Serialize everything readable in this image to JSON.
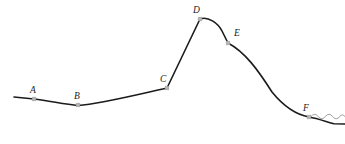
{
  "figure": {
    "width": 345,
    "height": 144,
    "background_color": "#ffffff",
    "curve_color": "#1b1b1b",
    "marker_color": "#b4b4b4",
    "label_color": "#222222",
    "squiggle_color": "#8d8d8d"
  },
  "points": [
    {
      "id": "A",
      "label": "A",
      "x": 34,
      "y": 99,
      "label_x": 30,
      "label_y": 93
    },
    {
      "id": "B",
      "label": "B",
      "x": 78,
      "y": 105,
      "label_x": 74,
      "label_y": 99
    },
    {
      "id": "C",
      "label": "C",
      "x": 167,
      "y": 88,
      "label_x": 160,
      "label_y": 82
    },
    {
      "id": "D",
      "label": "D",
      "x": 200,
      "y": 19,
      "label_x": 193,
      "label_y": 13
    },
    {
      "id": "E",
      "label": "E",
      "x": 228,
      "y": 43,
      "label_x": 234,
      "label_y": 36
    },
    {
      "id": "F",
      "label": "F",
      "x": 309,
      "y": 117,
      "label_x": 303,
      "label_y": 111
    }
  ],
  "paths": {
    "main_curve": "M 14,97 L 34,99 C 50,101 64,104 78,105.5 C 100,104 140,94 167,88 L 200,19 C 208,16 218,23 222,31 L 228,43 C 245,52 258,70 272,92 C 285,108 298,115 309,117 C 318,118.5 327,122 334,123.8 L 345,124",
    "squiggle": "M 311,116.5 q 3.6,-4.4 7.2,0 q 3.6,4.4 7.2,0 q 3.6,-4.4 7.2,0 q 3.6,4.4 7.2,0 q 2.6,-3.2 5.2,0"
  },
  "marker_radius": 1.9
}
